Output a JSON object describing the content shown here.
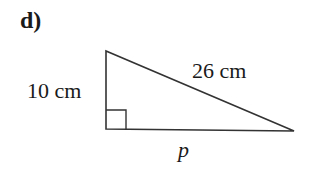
{
  "question": {
    "label": "d)"
  },
  "triangle": {
    "type": "right-triangle",
    "vertices": {
      "top": [
        106,
        51
      ],
      "right_angle": [
        106,
        129
      ],
      "right": [
        294,
        131
      ]
    },
    "sides": {
      "vertical": "10 cm",
      "hypotenuse": "26 cm",
      "base": "p"
    },
    "right_angle_marker": true,
    "stroke_color": "#333333"
  }
}
